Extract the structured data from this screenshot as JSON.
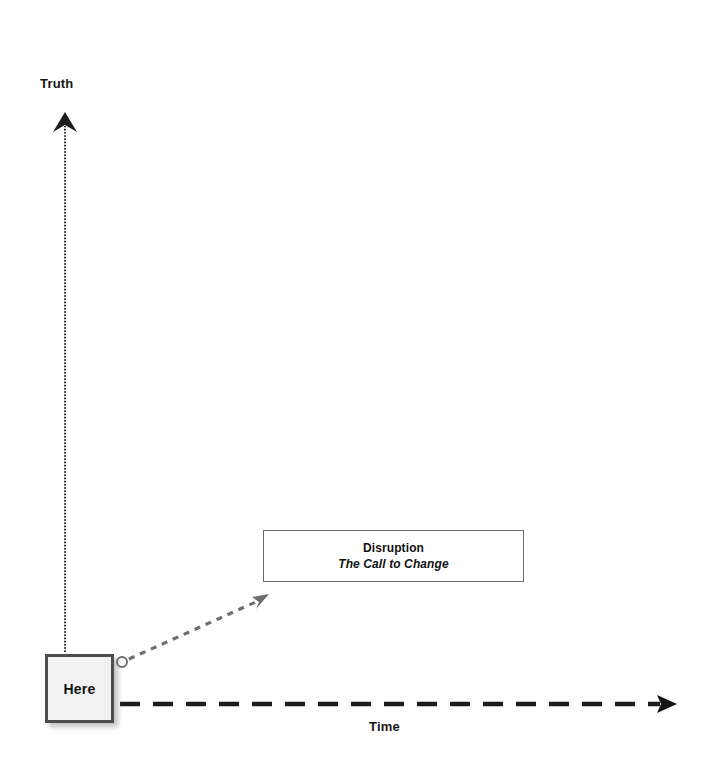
{
  "diagram": {
    "axes": {
      "vertical": {
        "label": "Truth",
        "style": "dotted",
        "arrow": "up",
        "color": "#2a2a2a"
      },
      "horizontal": {
        "label": "Time",
        "style": "dashed",
        "arrow": "right",
        "color": "#1c1c1c"
      }
    },
    "nodes": {
      "here": {
        "label": "Here",
        "fill": "#f2f2f2",
        "border": "#4d4d4d"
      },
      "disruption": {
        "title": "Disruption",
        "subtitle": "The Call to Change",
        "fill": "#ffffff",
        "border": "#6b6b6b"
      }
    },
    "connector": {
      "name": "here-to-disruption",
      "style": "dashed",
      "color": "#6e6e6e",
      "start_marker": "circle",
      "end_marker": "arrow"
    }
  }
}
